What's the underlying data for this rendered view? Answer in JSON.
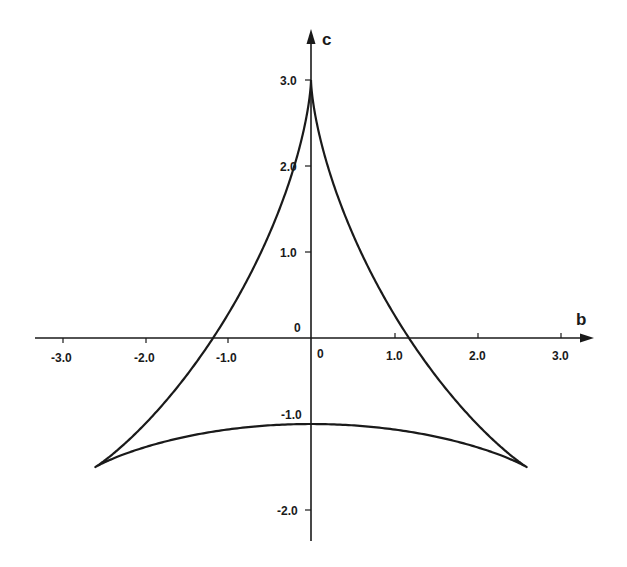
{
  "chart_data": {
    "type": "line",
    "title": "",
    "xlabel": "b",
    "ylabel": "c",
    "xlim": [
      -3.3,
      3.4
    ],
    "ylim": [
      -2.4,
      3.6
    ],
    "grid": false,
    "legend": null,
    "x_ticks": [
      -3.0,
      -2.0,
      -1.0,
      1.0,
      2.0,
      3.0
    ],
    "x_tick_labels": [
      "-3.0",
      "-2.0",
      "-1.0",
      "1.0",
      "2.0",
      "3.0"
    ],
    "y_ticks": [
      3.0,
      2.0,
      1.0,
      -1.0,
      -2.0
    ],
    "y_tick_labels": [
      "3.0",
      "2.0",
      "1.0",
      "-1.0",
      "-2.0"
    ],
    "origin_labels": [
      "0",
      "0"
    ],
    "series": [
      {
        "name": "deltoid",
        "parametric": "b = 2 sin t - sin 2t, c = 2 cos t + cos 2t, t in [0, 2pi]",
        "key_points": [
          {
            "b": 0.0,
            "c": 3.0,
            "note": "top cusp"
          },
          {
            "b": -2.6,
            "c": -1.5,
            "note": "bottom-left cusp"
          },
          {
            "b": 2.6,
            "c": -1.5,
            "note": "bottom-right cusp"
          },
          {
            "b": 0.0,
            "c": -1.0,
            "note": "bottom arc midpoint"
          },
          {
            "b": -1.2,
            "c": 0.0,
            "note": "left axis crossing"
          },
          {
            "b": 1.2,
            "c": 0.0,
            "note": "right axis crossing"
          }
        ]
      }
    ]
  },
  "axes": {
    "x_label": "b",
    "y_label": "c",
    "origin_x_label": "0",
    "origin_y_label": "0"
  },
  "ticks": {
    "x": [
      {
        "v": -3.0,
        "label": "-3.0"
      },
      {
        "v": -2.0,
        "label": "-2.0"
      },
      {
        "v": -1.0,
        "label": "-1.0"
      },
      {
        "v": 1.0,
        "label": "1.0"
      },
      {
        "v": 2.0,
        "label": "2.0"
      },
      {
        "v": 3.0,
        "label": "3.0"
      }
    ],
    "y": [
      {
        "v": 3.0,
        "label": "3.0"
      },
      {
        "v": 2.0,
        "label": "2.0"
      },
      {
        "v": 1.0,
        "label": "1.0"
      },
      {
        "v": -1.0,
        "label": "-1.0"
      },
      {
        "v": -2.0,
        "label": "-2.0"
      }
    ]
  },
  "colors": {
    "ink": "#1a1a1a",
    "background": "#ffffff"
  }
}
